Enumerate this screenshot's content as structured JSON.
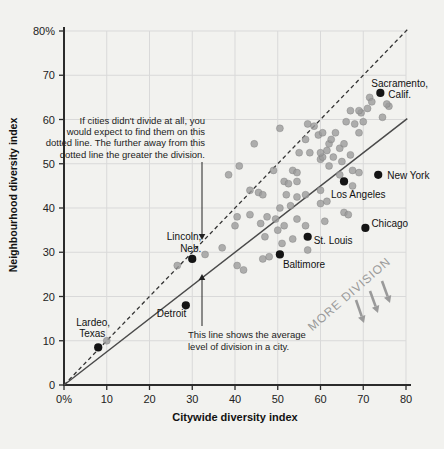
{
  "figure": {
    "background": "#f2f2ef",
    "colors": {
      "gray_dot": "#9b9b9b",
      "black_dot": "#141414",
      "grid": "#d9d9d9",
      "axis": "#2b2b2b",
      "dashed_line": "#333333",
      "solid_line": "#4a4a4a",
      "annotation_gray": "#9a9a9a",
      "text": "#1c1c1c"
    }
  },
  "chart_data": {
    "type": "scatter",
    "title": "",
    "xlabel": "Citywide diversity index",
    "ylabel": "Neighbourhood diversity index",
    "xlim": [
      0,
      80
    ],
    "ylim": [
      0,
      80
    ],
    "grid": true,
    "x_ticks": [
      {
        "value": 0,
        "label": "0%"
      },
      {
        "value": 10,
        "label": "10"
      },
      {
        "value": 20,
        "label": "20"
      },
      {
        "value": 30,
        "label": "30"
      },
      {
        "value": 40,
        "label": "40"
      },
      {
        "value": 50,
        "label": "50"
      },
      {
        "value": 60,
        "label": "60"
      },
      {
        "value": 70,
        "label": "70"
      },
      {
        "value": 80,
        "label": "80"
      }
    ],
    "y_ticks": [
      {
        "value": 0,
        "label": "0"
      },
      {
        "value": 10,
        "label": "10"
      },
      {
        "value": 20,
        "label": "20"
      },
      {
        "value": 30,
        "label": "30"
      },
      {
        "value": 40,
        "label": "40"
      },
      {
        "value": 50,
        "label": "50"
      },
      {
        "value": 60,
        "label": "60"
      },
      {
        "value": 70,
        "label": "70"
      },
      {
        "value": 80,
        "label": "80%"
      }
    ],
    "reference_lines": [
      {
        "name": "no-division-dotted-line",
        "style": "dashed",
        "x1": 0,
        "y1": 0,
        "x2": 80.5,
        "y2": 80.5
      },
      {
        "name": "average-division-line",
        "style": "solid",
        "x1": 0,
        "y1": 0,
        "x2": 80.3,
        "y2": 60.2
      }
    ],
    "series": [
      {
        "name": "unlabeled-cities",
        "marker": "circle",
        "color": "#9b9b9b",
        "points": [
          [
            10,
            10
          ],
          [
            26.5,
            27
          ],
          [
            33,
            29.5
          ],
          [
            37,
            31
          ],
          [
            40.5,
            27
          ],
          [
            42,
            26
          ],
          [
            46.5,
            28.5
          ],
          [
            48,
            29
          ],
          [
            57,
            30.5
          ],
          [
            51,
            32
          ],
          [
            53.5,
            33
          ],
          [
            47,
            33.5
          ],
          [
            50,
            35
          ],
          [
            40,
            36
          ],
          [
            46,
            36.5
          ],
          [
            49.5,
            37.5
          ],
          [
            51.5,
            36
          ],
          [
            54.5,
            37.5
          ],
          [
            56.5,
            36
          ],
          [
            61,
            37
          ],
          [
            40.5,
            38
          ],
          [
            43.5,
            38.5
          ],
          [
            47.5,
            38
          ],
          [
            65.5,
            39
          ],
          [
            66.5,
            38.5
          ],
          [
            50.5,
            40
          ],
          [
            53,
            40.5
          ],
          [
            60,
            41
          ],
          [
            61.5,
            41.5
          ],
          [
            52,
            43
          ],
          [
            54.5,
            42.5
          ],
          [
            56.5,
            43
          ],
          [
            43.5,
            44
          ],
          [
            45.5,
            43.5
          ],
          [
            46.5,
            43
          ],
          [
            60,
            44
          ],
          [
            67.5,
            45
          ],
          [
            51.5,
            46
          ],
          [
            52.5,
            45.5
          ],
          [
            54.5,
            46
          ],
          [
            38.5,
            47.5
          ],
          [
            64.5,
            47.5
          ],
          [
            49,
            48.5
          ],
          [
            53.5,
            48.5
          ],
          [
            54.5,
            48
          ],
          [
            67.5,
            48.5
          ],
          [
            69,
            48
          ],
          [
            41,
            49.5
          ],
          [
            62,
            49.5
          ],
          [
            60,
            51
          ],
          [
            65,
            50.5
          ],
          [
            60.5,
            51.5
          ],
          [
            67,
            52
          ],
          [
            55,
            52.5
          ],
          [
            57.5,
            52.5
          ],
          [
            60,
            52.5
          ],
          [
            61.5,
            53
          ],
          [
            64.5,
            53.5
          ],
          [
            44.5,
            54.5
          ],
          [
            62,
            54.5
          ],
          [
            65.5,
            54.5
          ],
          [
            63,
            51.5
          ],
          [
            50.5,
            58
          ],
          [
            56.5,
            55.5
          ],
          [
            58.5,
            58.5
          ],
          [
            59.5,
            56.5
          ],
          [
            62.5,
            55.5
          ],
          [
            57,
            59
          ],
          [
            60.5,
            57
          ],
          [
            63.5,
            57
          ],
          [
            69,
            57
          ],
          [
            68,
            59
          ],
          [
            66,
            59.5
          ],
          [
            70,
            59.5
          ],
          [
            74.5,
            60.5
          ],
          [
            69.5,
            61.5
          ],
          [
            67,
            62
          ],
          [
            69,
            62
          ],
          [
            71,
            62.5
          ],
          [
            76,
            63
          ],
          [
            71.5,
            65
          ],
          [
            75.5,
            63.5
          ],
          [
            72,
            64
          ]
        ]
      },
      {
        "name": "labeled-cities",
        "marker": "circle",
        "color": "#141414",
        "cities": [
          {
            "name": "Sacramento, Calif.",
            "x": 74,
            "y": 66,
            "label_lines": [
              "Sacramento,",
              "Calif."
            ],
            "anchor": "start",
            "offsets": [
              [
                -9,
                -6
              ],
              [
                8,
                5
              ]
            ]
          },
          {
            "name": "New York",
            "x": 73.5,
            "y": 47.5,
            "label_lines": [
              "New York"
            ],
            "anchor": "start",
            "offsets": [
              [
                9,
                4
              ]
            ]
          },
          {
            "name": "Los Angeles",
            "x": 65.5,
            "y": 46,
            "label_lines": [
              "Los Angeles"
            ],
            "anchor": "start",
            "offsets": [
              [
                -13,
                17
              ]
            ]
          },
          {
            "name": "Chicago",
            "x": 70.5,
            "y": 35.5,
            "label_lines": [
              "Chicago"
            ],
            "anchor": "start",
            "offsets": [
              [
                6,
                -1
              ]
            ]
          },
          {
            "name": "St. Louis",
            "x": 57,
            "y": 33.5,
            "label_lines": [
              "St. Louis"
            ],
            "anchor": "start",
            "offsets": [
              [
                6,
                7
              ]
            ]
          },
          {
            "name": "Baltimore",
            "x": 50.5,
            "y": 29.5,
            "label_lines": [
              "Baltimore"
            ],
            "anchor": "start",
            "offsets": [
              [
                3,
                14
              ]
            ]
          },
          {
            "name": "Detroit",
            "x": 28.5,
            "y": 18,
            "label_lines": [
              "Detroit"
            ],
            "anchor": "start",
            "offsets": [
              [
                -29,
                12
              ]
            ]
          },
          {
            "name": "Lincoln, Neb.",
            "x": 30,
            "y": 28.5,
            "label_lines": [
              "Lincoln,",
              "Neb."
            ],
            "anchor": "end",
            "offsets": [
              [
                9,
                -19
              ],
              [
                9,
                -7
              ]
            ]
          },
          {
            "name": "Lardeo, Texas",
            "x": 8,
            "y": 8.5,
            "label_lines": [
              "Lardeo,",
              "Texas"
            ],
            "anchor": "middle",
            "offsets": [
              [
                -5,
                -21
              ],
              [
                -6,
                -10
              ]
            ]
          }
        ]
      }
    ],
    "annotations": {
      "dotted_line_note": {
        "lines": [
          "If cities didn't divide at all, you",
          "would expect to find them on this",
          "dotted line. The further away from this",
          "dotted line the greater the division."
        ],
        "anchor": "end",
        "x": 205,
        "y": 124,
        "line_height": 11.2,
        "arrow": {
          "x1": 202,
          "y1": 162,
          "x2": 202,
          "y2": 240
        }
      },
      "solid_line_note": {
        "lines": [
          "This line shows the average",
          "level of division in a city."
        ],
        "anchor": "start",
        "x": 188,
        "y": 338,
        "line_height": 11.5,
        "arrow": {
          "x1": 202,
          "y1": 326,
          "x2": 202,
          "y2": 274
        }
      },
      "more_division": {
        "text": "MORE DIVISION",
        "cx": 352,
        "cy": 297,
        "angle": -41,
        "arrows": [
          {
            "x1": 356,
            "y1": 300,
            "x2": 364,
            "y2": 323
          },
          {
            "x1": 370,
            "y1": 291,
            "x2": 378,
            "y2": 313
          },
          {
            "x1": 382,
            "y1": 281,
            "x2": 390,
            "y2": 303
          }
        ]
      }
    },
    "layout": {
      "x0_px": 64,
      "y0_px": 385,
      "px_per_x": 4.275,
      "px_per_y": 4.425
    }
  }
}
